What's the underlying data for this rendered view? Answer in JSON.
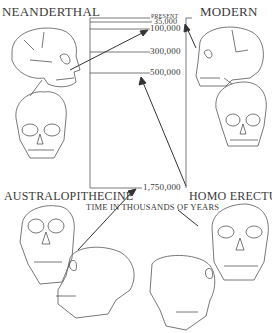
{
  "labels": {
    "neanderthal": "NEANDERTHAL",
    "modern": "MODERN",
    "australopithecine": "AUSTRALOPITHECINE",
    "homo_erectus": "HOMO ERECTUS",
    "axis_title": "TIME IN THOUSANDS OF YEARS"
  },
  "timeline": {
    "ticks": [
      {
        "label": "PRESENT",
        "y": 17
      },
      {
        "label": "35,000",
        "y": 21
      },
      {
        "label": "100,000",
        "y": 28
      },
      {
        "label": "300,000",
        "y": 52
      },
      {
        "label": "500,000",
        "y": 73
      },
      {
        "label": "1,750,000",
        "y": 187
      }
    ]
  },
  "colors": {
    "ink": "#3a3a3a",
    "background": "#ffffff"
  }
}
